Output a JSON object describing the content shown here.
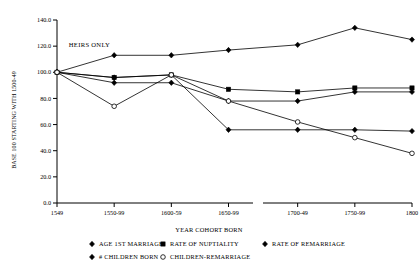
{
  "chart_data": {
    "type": "line",
    "title": "",
    "xlabel": "YEAR COHORT BORN",
    "ylabel": "BASE 100 STARTING WITH 1500-49",
    "categories": [
      "1549",
      "1550-99",
      "1600-59",
      "1650-99",
      "1700-49",
      "1750-99",
      "1800"
    ],
    "axis_break_after_category": "1650-99",
    "ylim": [
      0,
      140
    ],
    "yticks": [
      0,
      20,
      40,
      60,
      80,
      100,
      120,
      140
    ],
    "ytick_labels": [
      "0.0",
      "20.0",
      "40.0",
      "60.0",
      "80.0",
      "100.0",
      "120.0",
      "140.0"
    ],
    "grid": false,
    "legend_position": "bottom",
    "annotations": [
      {
        "text": "HEIRS ONLY",
        "x_category": "1550-99",
        "y": 119
      }
    ],
    "series": [
      {
        "name": "AGE 1ST MARRIAGE",
        "marker": "diamond-filled",
        "values": [
          100,
          113,
          113,
          117,
          121,
          134,
          125
        ]
      },
      {
        "name": "RATE OF NUPTIALITY",
        "marker": "square-filled",
        "values": [
          100,
          96,
          98,
          87,
          85,
          88,
          88
        ]
      },
      {
        "name": "RATE OF REMARRIAGE",
        "marker": "diamond-filled",
        "values": [
          100,
          92,
          92,
          78,
          78,
          85,
          85
        ]
      },
      {
        "name": "# CHILDREN BORN",
        "marker": "diamond-filled",
        "values": [
          100,
          96,
          98,
          56,
          56,
          56,
          55
        ]
      },
      {
        "name": "CHILDREN-REMARRIAGE",
        "marker": "circle-open",
        "values": [
          100,
          74,
          98,
          78,
          62,
          50,
          38
        ]
      }
    ]
  },
  "legend": {
    "items": [
      {
        "label": "AGE 1ST MARRIAGE",
        "marker": "diamond-filled"
      },
      {
        "label": "RATE OF NUPTIALITY",
        "marker": "square-filled"
      },
      {
        "label": "RATE OF REMARRIAGE",
        "marker": "diamond-filled"
      },
      {
        "label": "# CHILDREN BORN",
        "marker": "diamond-filled"
      },
      {
        "label": "CHILDREN-REMARRIAGE",
        "marker": "circle-open"
      }
    ]
  },
  "colors": {
    "ink": "#000000",
    "background": "#ffffff"
  }
}
